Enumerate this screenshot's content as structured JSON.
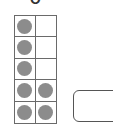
{
  "header": {
    "digit": "0"
  },
  "ten_frame": {
    "rows": 5,
    "cols": 2,
    "filled": [
      [
        true,
        false
      ],
      [
        true,
        false
      ],
      [
        true,
        false
      ],
      [
        true,
        true
      ],
      [
        true,
        true
      ]
    ],
    "dot_color": "#8c8c8c",
    "count": 7
  },
  "answer_box": {
    "value": ""
  }
}
